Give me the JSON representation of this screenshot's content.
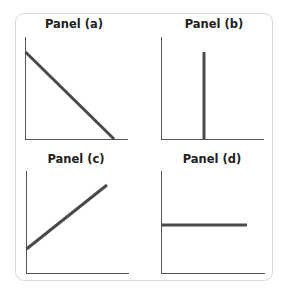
{
  "panels": [
    {
      "id": "a",
      "title": "Panel (a)",
      "shape": "downward-sloping line"
    },
    {
      "id": "b",
      "title": "Panel (b)",
      "shape": "vertical line"
    },
    {
      "id": "c",
      "title": "Panel (c)",
      "shape": "upward-sloping line"
    },
    {
      "id": "d",
      "title": "Panel (d)",
      "shape": "horizontal line"
    }
  ],
  "colors": {
    "axis": "#555555",
    "line": "#4a4a4a",
    "frame": "#d9d9d9"
  }
}
